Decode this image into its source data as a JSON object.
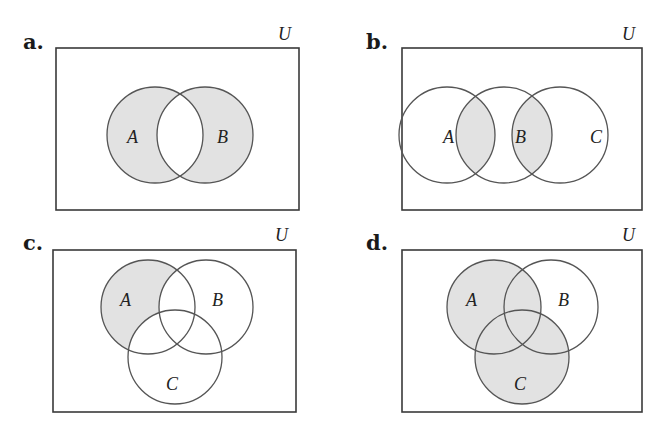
{
  "figure": {
    "universe_label": "U",
    "shade_color": "#e2e2e2",
    "stroke_color": "#555555",
    "panels": [
      {
        "id": "a",
        "label": "a.",
        "sets": [
          {
            "name": "A",
            "cx": 155,
            "cy": 135,
            "r": 48
          },
          {
            "name": "B",
            "cx": 205,
            "cy": 135,
            "r": 48
          }
        ],
        "shaded_region": "(A ∪ B) − (A ∩ B)"
      },
      {
        "id": "b",
        "label": "b.",
        "sets": [
          {
            "name": "A",
            "cx": 447,
            "cy": 135,
            "r": 48
          },
          {
            "name": "B",
            "cx": 504,
            "cy": 135,
            "r": 48
          },
          {
            "name": "C",
            "cx": 560,
            "cy": 135,
            "r": 48
          }
        ],
        "shaded_region": "(A ∩ B) ∪ (B ∩ C)"
      },
      {
        "id": "c",
        "label": "c.",
        "sets": [
          {
            "name": "A",
            "cx": 148,
            "cy": 307,
            "r": 47
          },
          {
            "name": "B",
            "cx": 206,
            "cy": 307,
            "r": 47
          },
          {
            "name": "C",
            "cx": 175,
            "cy": 357,
            "r": 47
          }
        ],
        "shaded_region": "A − (B ∪ C)"
      },
      {
        "id": "d",
        "label": "d.",
        "sets": [
          {
            "name": "A",
            "cx": 494,
            "cy": 307,
            "r": 47
          },
          {
            "name": "B",
            "cx": 551,
            "cy": 307,
            "r": 47
          },
          {
            "name": "C",
            "cx": 522,
            "cy": 357,
            "r": 47
          }
        ],
        "shaded_region": "A ∪ C"
      }
    ]
  }
}
